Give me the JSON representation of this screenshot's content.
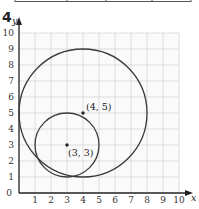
{
  "problem_number": "4",
  "header_table_fragment": {
    "border_color": "#555555",
    "column_dividers_x": [
      15,
      67,
      106,
      152,
      191
    ]
  },
  "chart_data": {
    "type": "scatter",
    "title": "",
    "xlabel": "x",
    "ylabel": "y",
    "xlim": [
      0,
      10
    ],
    "ylim": [
      0,
      10
    ],
    "grid": true,
    "x_ticks": [
      "1",
      "2",
      "3",
      "4",
      "5",
      "6",
      "7",
      "8",
      "9",
      "10"
    ],
    "y_ticks": [
      "1",
      "2",
      "3",
      "4",
      "5",
      "6",
      "7",
      "8",
      "9",
      "10"
    ],
    "origin_label": "0",
    "circles": [
      {
        "name": "large circle",
        "center": [
          4,
          5
        ],
        "radius": 4
      },
      {
        "name": "small circle",
        "center": [
          3,
          3
        ],
        "radius": 2
      }
    ],
    "points": [
      {
        "x": 4,
        "y": 5,
        "label": "(4, 5)"
      },
      {
        "x": 3,
        "y": 3,
        "label": "(3, 3)"
      }
    ],
    "colors": {
      "grid": "#d6d6d6",
      "axis": "#222222",
      "curve": "#3a3a3a"
    }
  }
}
